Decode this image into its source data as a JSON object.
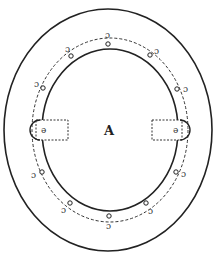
{
  "figure": {
    "center_label": "A",
    "stroke_color": "#222222",
    "background": "#ffffff",
    "outer_ellipse": {
      "cx": 108,
      "cy": 130,
      "rx": 104,
      "ry": 121
    },
    "inner_ellipse": {
      "cx": 110,
      "cy": 130,
      "rx": 68,
      "ry": 81
    },
    "dashed_ring": {
      "cx": 110,
      "cy": 130,
      "rx": 78,
      "ry": 92
    },
    "left_rect": {
      "x": 36,
      "y": 120,
      "w": 32,
      "h": 20
    },
    "right_rect": {
      "x": 152,
      "y": 120,
      "w": 30,
      "h": 20
    },
    "hole_marks": [
      {
        "x": 108,
        "y": 44,
        "glyph": "o"
      },
      {
        "x": 108,
        "y": 35,
        "glyph": "ɔ"
      },
      {
        "x": 71,
        "y": 56,
        "glyph": "o"
      },
      {
        "x": 68,
        "y": 49,
        "glyph": "ɔ"
      },
      {
        "x": 150,
        "y": 55,
        "glyph": "o"
      },
      {
        "x": 157,
        "y": 51,
        "glyph": "ɔ"
      },
      {
        "x": 43,
        "y": 88,
        "glyph": "o"
      },
      {
        "x": 37,
        "y": 84,
        "glyph": "ɔ"
      },
      {
        "x": 177,
        "y": 89,
        "glyph": "o"
      },
      {
        "x": 186,
        "y": 89,
        "glyph": "ɔ"
      },
      {
        "x": 42,
        "y": 172,
        "glyph": "o"
      },
      {
        "x": 34,
        "y": 175,
        "glyph": "ɔ"
      },
      {
        "x": 176,
        "y": 172,
        "glyph": "o"
      },
      {
        "x": 184,
        "y": 174,
        "glyph": "ɔ"
      },
      {
        "x": 70,
        "y": 203,
        "glyph": "o"
      },
      {
        "x": 64,
        "y": 210,
        "glyph": "ɔ"
      },
      {
        "x": 146,
        "y": 203,
        "glyph": "o"
      },
      {
        "x": 151,
        "y": 211,
        "glyph": "ɔ"
      },
      {
        "x": 109,
        "y": 216,
        "glyph": "o"
      },
      {
        "x": 109,
        "y": 226,
        "glyph": "ɔ"
      }
    ]
  }
}
